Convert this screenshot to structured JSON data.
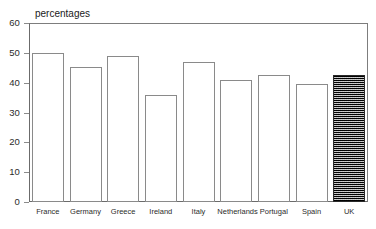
{
  "chart_data": {
    "type": "bar",
    "title": "percentages",
    "xlabel": "",
    "ylabel": "",
    "ylim": [
      0,
      60
    ],
    "yticks": [
      0,
      10,
      20,
      30,
      40,
      50,
      60
    ],
    "ytick_labels": [
      "0",
      "10",
      "20",
      "30",
      "40",
      "50",
      "60"
    ],
    "grid": false,
    "legend": false,
    "categories": [
      "France",
      "Germany",
      "Greece",
      "Ireland",
      "Italy",
      "Netherlands",
      "Portugal",
      "Spain",
      "UK"
    ],
    "values": [
      50.0,
      45.2,
      49.0,
      36.0,
      47.0,
      41.0,
      42.5,
      39.5,
      42.5
    ],
    "bar_styles": [
      "open",
      "open",
      "open",
      "open",
      "open",
      "open",
      "open",
      "open",
      "hatched"
    ],
    "colors": {
      "bar_outline": "#8a8a8a",
      "bar_fill": "#ffffff",
      "highlight_bar_fill": "#3a3a3a",
      "highlight_bar_outline": "#2a2a2a",
      "axis": "#6b6b6b",
      "text": "#1a1a1a",
      "background": "#ffffff"
    }
  }
}
